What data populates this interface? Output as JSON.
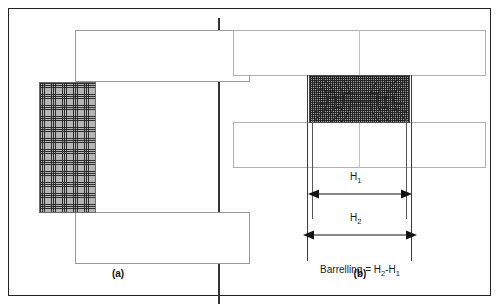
{
  "figure": {
    "panels": [
      {
        "id": "a",
        "label": "(a)",
        "description": "undeformed billet mesh between flat dies"
      },
      {
        "id": "b",
        "label": "(b)",
        "description": "barrelled deformed billet between flat dies"
      }
    ]
  },
  "panel_a": {
    "label": "(a)",
    "die_top_name": "upper-die",
    "die_bottom_name": "lower-die",
    "billet_name": "billet-mesh"
  },
  "panel_b": {
    "label": "(b)",
    "die_top_name": "upper-die",
    "die_bottom_name": "lower-die",
    "billet_name": "deformed-billet-mesh",
    "dimensions": [
      {
        "key": "H1",
        "label": "H",
        "subscript": "1"
      },
      {
        "key": "H2",
        "label": "H",
        "subscript": "2"
      }
    ],
    "caption_prefix": "Barrelling = H",
    "caption_sub1": "2",
    "caption_mid": "-H",
    "caption_sub2": "1",
    "caption_full": "Barrelling = H2-H1"
  },
  "colors": {
    "frame": "#222222",
    "divider": "#333333",
    "die_outline_a": "#9a9a9a",
    "die_outline_b": "#b0b0b0",
    "mesh_fill": "#9d9d9d",
    "arrow": "#111111",
    "text": "#1a1a1a",
    "background": "#ffffff"
  }
}
